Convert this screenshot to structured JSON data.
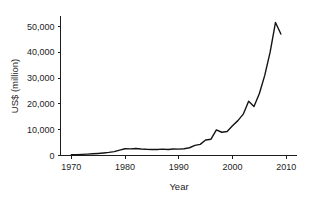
{
  "chart_data": {
    "type": "line",
    "title": "",
    "subtitle": "",
    "xlabel": "Year",
    "ylabel": "US$ (million)",
    "xlim": [
      1968,
      2012
    ],
    "ylim": [
      0,
      54000
    ],
    "xticks": [
      1970,
      1980,
      1990,
      2000,
      2010
    ],
    "xtick_labels": [
      "1970",
      "1980",
      "1990",
      "2000",
      "2010"
    ],
    "yticks": [
      0,
      10000,
      20000,
      30000,
      40000,
      50000
    ],
    "ytick_labels": [
      "0",
      "10,000",
      "20,000",
      "30,000",
      "40,000",
      "50,000"
    ],
    "grid": false,
    "legend": false,
    "legend_position": "none",
    "line_color": "#141414",
    "background_color": "#ffffff",
    "axis_color": "#1d1d1d",
    "series": [
      {
        "name": "US$ (million)",
        "x": [
          1970,
          1971,
          1972,
          1973,
          1974,
          1975,
          1976,
          1977,
          1978,
          1979,
          1980,
          1981,
          1982,
          1983,
          1984,
          1985,
          1986,
          1987,
          1988,
          1989,
          1990,
          1991,
          1992,
          1993,
          1994,
          1995,
          1996,
          1997,
          1998,
          1999,
          2000,
          2001,
          2002,
          2003,
          2004,
          2005,
          2006,
          2007,
          2008,
          2009
        ],
        "values": [
          300,
          350,
          420,
          520,
          650,
          800,
          980,
          1200,
          1500,
          2100,
          2600,
          2550,
          2700,
          2500,
          2400,
          2350,
          2300,
          2450,
          2300,
          2500,
          2450,
          2600,
          3000,
          3900,
          4300,
          6000,
          6300,
          9900,
          9000,
          9300,
          11500,
          13500,
          16000,
          21000,
          19000,
          24000,
          31000,
          40000,
          51500,
          47000
        ]
      }
    ],
    "annotations": []
  },
  "axis": {
    "y_title": "US$ (million)",
    "x_title": "Year"
  }
}
